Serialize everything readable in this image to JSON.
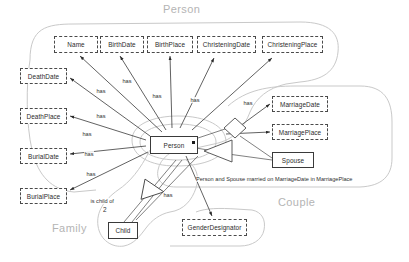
{
  "diagram": {
    "background": "#ffffff",
    "regions": [
      {
        "id": "person",
        "label": "Person",
        "x": 163,
        "y": 3,
        "color": "#b4b4b4"
      },
      {
        "id": "family",
        "label": "Family",
        "x": 52,
        "y": 222,
        "color": "#b4b4b4"
      },
      {
        "id": "couple",
        "label": "Couple",
        "x": 278,
        "y": 196,
        "color": "#b4b4b4"
      }
    ],
    "nodes": [
      {
        "id": "name",
        "label": "Name",
        "style": "dashed",
        "x": 54,
        "y": 36,
        "w": 44,
        "h": 17
      },
      {
        "id": "birthdate",
        "label": "BirthDate",
        "style": "dashed",
        "x": 100,
        "y": 36,
        "w": 44,
        "h": 17
      },
      {
        "id": "birthplace",
        "label": "BirthPlace",
        "style": "dashed",
        "x": 147,
        "y": 36,
        "w": 46,
        "h": 17
      },
      {
        "id": "christeningdate",
        "label": "ChristeningDate",
        "style": "dashed",
        "x": 197,
        "y": 36,
        "w": 59,
        "h": 17
      },
      {
        "id": "christeningplace",
        "label": "ChristeningPlace",
        "style": "dashed",
        "x": 262,
        "y": 36,
        "w": 61,
        "h": 17
      },
      {
        "id": "deathdate",
        "label": "DeathDate",
        "style": "dashed",
        "x": 20,
        "y": 68,
        "w": 47,
        "h": 16
      },
      {
        "id": "deathplace",
        "label": "DeathPlace",
        "style": "dashed",
        "x": 20,
        "y": 108,
        "w": 47,
        "h": 16
      },
      {
        "id": "burialdate",
        "label": "BurialDate",
        "style": "dashed",
        "x": 20,
        "y": 148,
        "w": 47,
        "h": 16
      },
      {
        "id": "burialplace",
        "label": "BurialPlace",
        "style": "dashed",
        "x": 20,
        "y": 188,
        "w": 47,
        "h": 16
      },
      {
        "id": "marriagedate",
        "label": "MarriageDate",
        "style": "dashed",
        "x": 272,
        "y": 96,
        "w": 56,
        "h": 16
      },
      {
        "id": "marriageplace",
        "label": "MarriagePlace",
        "style": "dashed",
        "x": 272,
        "y": 124,
        "w": 56,
        "h": 16
      },
      {
        "id": "spouse",
        "label": "Spouse",
        "style": "solid",
        "x": 272,
        "y": 152,
        "w": 42,
        "h": 16
      },
      {
        "id": "person",
        "label": "Person",
        "style": "solid",
        "x": 150,
        "y": 136,
        "w": 48,
        "h": 18
      },
      {
        "id": "child",
        "label": "Child",
        "style": "solid",
        "x": 108,
        "y": 222,
        "w": 30,
        "h": 17
      },
      {
        "id": "genderdesignator",
        "label": "GenderDesignator",
        "style": "dashed",
        "x": 182,
        "y": 219,
        "w": 65,
        "h": 17
      }
    ],
    "edge_labels": [
      {
        "id": "has-name",
        "text": "has",
        "x": 96,
        "y": 88
      },
      {
        "id": "has-birthdate",
        "text": "has",
        "x": 122,
        "y": 78
      },
      {
        "id": "has-birthplace",
        "text": "has",
        "x": 152,
        "y": 93
      },
      {
        "id": "has-christeningdate",
        "text": "has",
        "x": 190,
        "y": 97
      },
      {
        "id": "has-christeningplace",
        "text": "has",
        "x": 243,
        "y": 100
      },
      {
        "id": "has-deathdate",
        "text": "has",
        "x": 96,
        "y": 113
      },
      {
        "id": "has-deathplace",
        "text": "has",
        "x": 82,
        "y": 131
      },
      {
        "id": "has-burialdate",
        "text": "has",
        "x": 84,
        "y": 151
      },
      {
        "id": "has-burialplace",
        "text": "has",
        "x": 86,
        "y": 171
      },
      {
        "id": "has-gender",
        "text": "has",
        "x": 163,
        "y": 192
      },
      {
        "id": "is-child-of",
        "text": "is child of",
        "x": 90,
        "y": 198
      }
    ],
    "cardinalities": [
      {
        "id": "child-cardinality",
        "text": "2",
        "x": 103,
        "y": 208
      }
    ],
    "sentences": [
      {
        "id": "marriage-fact",
        "text": "Person and Spouse married on MarriageDate in MarriagePlace",
        "x": 196,
        "y": 176
      }
    ],
    "shapes": {
      "diamond_label": "marriage-diamond",
      "triangle_label": "generalization-triangle",
      "person_marker_label": "person-role-marker"
    }
  }
}
